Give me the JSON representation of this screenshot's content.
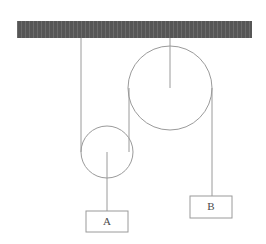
{
  "diagram": {
    "type": "mechanics-free-body-diagram",
    "colors": {
      "ceiling_fill": "#565656",
      "ceiling_hatch": "#6b6b6b",
      "line": "#9a9a9a",
      "box_stroke": "#9a9a9a",
      "label_text": "#4a4a4a",
      "background": "#ffffff"
    },
    "ceiling": {
      "name": "ceiling-support",
      "x": 17,
      "y": 21,
      "width": 235,
      "height": 17
    },
    "pulleys": [
      {
        "id": "small-pulley",
        "label": "movable-pulley",
        "cx": 107,
        "cy": 152,
        "r": 26
      },
      {
        "id": "large-pulley",
        "label": "fixed-pulley",
        "cx": 170,
        "cy": 88,
        "r": 42
      }
    ],
    "ropes": [
      {
        "id": "rope-ceiling-to-small-pulley",
        "x1": 81,
        "y1": 38,
        "x2": 81,
        "y2": 152
      },
      {
        "id": "rope-small-pulley-to-large-pulley",
        "x1": 129,
        "y1": 152,
        "x2": 129,
        "y2": 88
      },
      {
        "id": "rope-large-pulley-to-block-b",
        "x1": 212,
        "y1": 88,
        "x2": 212,
        "y2": 196
      },
      {
        "id": "rope-small-pulley-to-block-a",
        "x1": 107,
        "y1": 152,
        "x2": 107,
        "y2": 211
      },
      {
        "id": "spoke-ceiling-to-large-pulley-center",
        "x1": 170,
        "y1": 38,
        "x2": 170,
        "y2": 88
      }
    ],
    "blocks": [
      {
        "id": "block-a",
        "label": "A",
        "x": 86,
        "y": 211,
        "width": 42,
        "height": 21
      },
      {
        "id": "block-b",
        "label": "B",
        "x": 190,
        "y": 196,
        "width": 42,
        "height": 22
      }
    ]
  }
}
